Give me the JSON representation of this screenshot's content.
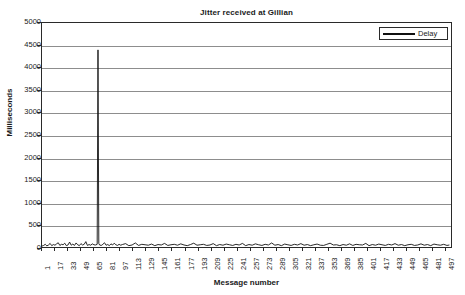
{
  "chart_data": {
    "type": "line",
    "title": "Jitter received at Gillian",
    "xlabel": "Message number",
    "ylabel": "Milliseconds",
    "grid": true,
    "legend_position": "top-right",
    "xlim": [
      1,
      505
    ],
    "ylim": [
      0,
      5000
    ],
    "ytick_labels": [
      "5000",
      "4500",
      "4000",
      "3500",
      "3000",
      "2500",
      "2000",
      "1500",
      "1000",
      "500",
      "0"
    ],
    "ytick_values": [
      5000,
      4500,
      4000,
      3500,
      3000,
      2500,
      2000,
      1500,
      1000,
      500,
      0
    ],
    "xtick_labels": [
      "1",
      "17",
      "33",
      "49",
      "65",
      "81",
      "97",
      "113",
      "129",
      "145",
      "161",
      "177",
      "193",
      "209",
      "225",
      "241",
      "257",
      "273",
      "289",
      "305",
      "321",
      "337",
      "353",
      "369",
      "385",
      "401",
      "417",
      "433",
      "449",
      "465",
      "481",
      "497"
    ],
    "xtick_values": [
      1,
      17,
      33,
      49,
      65,
      81,
      97,
      113,
      129,
      145,
      161,
      177,
      193,
      209,
      225,
      241,
      257,
      273,
      289,
      305,
      321,
      337,
      353,
      369,
      385,
      401,
      417,
      433,
      449,
      465,
      481,
      497
    ],
    "series": [
      {
        "name": "Delay",
        "color": "#111111",
        "x": [
          1,
          3,
          5,
          7,
          9,
          11,
          13,
          15,
          17,
          19,
          21,
          23,
          25,
          27,
          29,
          31,
          33,
          35,
          37,
          39,
          41,
          43,
          45,
          47,
          49,
          51,
          53,
          55,
          57,
          59,
          61,
          63,
          65,
          67,
          69,
          70,
          71,
          72,
          74,
          76,
          78,
          80,
          82,
          84,
          86,
          88,
          90,
          92,
          94,
          96,
          98,
          100,
          104,
          108,
          112,
          116,
          120,
          124,
          128,
          132,
          136,
          140,
          144,
          148,
          152,
          156,
          160,
          164,
          168,
          172,
          176,
          180,
          184,
          188,
          192,
          196,
          200,
          204,
          208,
          212,
          216,
          220,
          224,
          228,
          232,
          236,
          240,
          244,
          248,
          252,
          256,
          260,
          264,
          268,
          272,
          276,
          280,
          284,
          288,
          292,
          296,
          300,
          304,
          308,
          312,
          316,
          320,
          324,
          328,
          332,
          336,
          340,
          344,
          348,
          352,
          356,
          360,
          364,
          368,
          372,
          376,
          380,
          384,
          388,
          392,
          396,
          400,
          404,
          408,
          412,
          416,
          420,
          424,
          428,
          432,
          436,
          440,
          444,
          448,
          452,
          456,
          460,
          464,
          468,
          472,
          476,
          480,
          484,
          488,
          492,
          496,
          500,
          503
        ],
        "values": [
          20,
          35,
          60,
          25,
          45,
          80,
          30,
          55,
          40,
          70,
          95,
          35,
          60,
          50,
          85,
          30,
          45,
          110,
          40,
          65,
          35,
          90,
          50,
          30,
          75,
          45,
          60,
          120,
          35,
          55,
          40,
          70,
          50,
          45,
          60,
          4400,
          80,
          45,
          35,
          60,
          95,
          40,
          55,
          30,
          70,
          45,
          85,
          50,
          35,
          60,
          40,
          55,
          75,
          30,
          45,
          90,
          35,
          60,
          50,
          40,
          65,
          30,
          55,
          45,
          80,
          35,
          50,
          60,
          40,
          70,
          45,
          30,
          55,
          85,
          40,
          50,
          60,
          35,
          45,
          75,
          30,
          55,
          40,
          65,
          50,
          35,
          60,
          45,
          80,
          30,
          55,
          40,
          70,
          50,
          35,
          60,
          45,
          90,
          40,
          55,
          30,
          65,
          50,
          35,
          60,
          45,
          75,
          40,
          55,
          30,
          50,
          65,
          40,
          35,
          60,
          85,
          45,
          50,
          30,
          55,
          40,
          70,
          35,
          60,
          50,
          45,
          80,
          30,
          55,
          40,
          65,
          50,
          35,
          60,
          45,
          75,
          40,
          55,
          30,
          50,
          60,
          35,
          45,
          70,
          40,
          55,
          30,
          65,
          50,
          40,
          60,
          35,
          45
        ]
      }
    ]
  }
}
